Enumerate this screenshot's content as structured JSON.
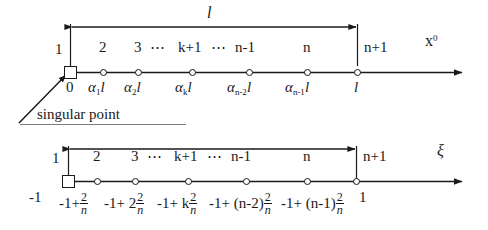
{
  "figure": {
    "kind": "two 1-D meshes: physical coordinate axis and natural (parametric) coordinate axis",
    "annotation": {
      "singular_point": "singular point"
    }
  },
  "top_axis": {
    "axis_name": "x",
    "axis_name_sup": "0",
    "dimension_label": "l",
    "node_numbers": [
      "1",
      "2",
      "3",
      "k+1",
      "n-1",
      "n",
      "n+1"
    ],
    "ellipsis": "⋯",
    "coords": [
      {
        "text": "0"
      },
      {
        "pre": "α",
        "sub": "1",
        "post": "l"
      },
      {
        "pre": "α",
        "sub": "2",
        "post": "l"
      },
      {
        "pre": "α",
        "sub": "k",
        "post": "l"
      },
      {
        "pre": "α",
        "sub": "n-2",
        "post": "l"
      },
      {
        "pre": "α",
        "sub": "n-1",
        "post": "l"
      },
      {
        "text": "l"
      }
    ]
  },
  "bottom_axis": {
    "axis_name": "ξ",
    "node_numbers": [
      "1",
      "2",
      "3",
      "k+1",
      "n-1",
      "n",
      "n+1"
    ],
    "ellipsis": "⋯",
    "coords": [
      {
        "lead": "-1",
        "frac": false
      },
      {
        "lead": "-1+",
        "frac": true,
        "num": "2",
        "den": "n"
      },
      {
        "lead": "-1+ 2",
        "frac": true,
        "num": "2",
        "den": "n"
      },
      {
        "lead": "-1+ k",
        "frac": true,
        "num": "2",
        "den": "n"
      },
      {
        "lead": "-1+ (n-2)",
        "frac": true,
        "num": "2",
        "den": "n"
      },
      {
        "lead": "-1+ (n-1)",
        "frac": true,
        "num": "2",
        "den": "n"
      },
      {
        "lead": "1",
        "frac": false
      }
    ]
  },
  "colors": {
    "ink": "#1a1a1a",
    "paper": "#ffffff"
  }
}
